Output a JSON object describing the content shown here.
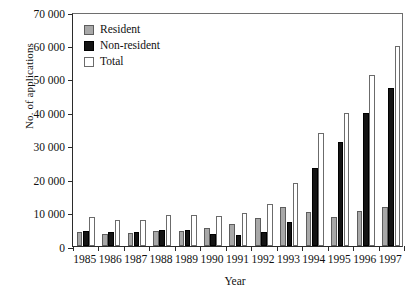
{
  "chart_data": {
    "type": "bar",
    "title": "",
    "xlabel": "Year",
    "ylabel": "No. of applications",
    "categories": [
      "1985",
      "1986",
      "1987",
      "1988",
      "1989",
      "1990",
      "1991",
      "1992",
      "1993",
      "1994",
      "1995",
      "1996",
      "1997"
    ],
    "series": [
      {
        "name": "Resident",
        "color": "#a8a8a8",
        "values": [
          4200,
          3500,
          3800,
          4600,
          4400,
          5400,
          6700,
          8300,
          11700,
          10300,
          8800,
          10600,
          11800
        ]
      },
      {
        "name": "Non-resident",
        "color": "#141414",
        "values": [
          4400,
          4300,
          4100,
          4700,
          4700,
          3700,
          3300,
          4200,
          7100,
          23200,
          31000,
          39800,
          47300
        ]
      },
      {
        "name": "Total",
        "color": "#ffffff",
        "values": [
          8700,
          7900,
          7900,
          9300,
          9200,
          9100,
          10000,
          12500,
          18800,
          33800,
          39800,
          51300,
          59700
        ]
      }
    ],
    "ylim": [
      0,
      70000
    ],
    "ytick_values": [
      0,
      10000,
      20000,
      30000,
      40000,
      50000,
      60000,
      70000
    ],
    "ytick_labels": [
      "0",
      "10 000",
      "20 000",
      "30 000",
      "40 000",
      "50 000",
      "60 000",
      "70 000"
    ],
    "grid": false,
    "legend_position": "top-left",
    "legend_entries": [
      "Resident",
      "Non-resident",
      "Total"
    ]
  }
}
